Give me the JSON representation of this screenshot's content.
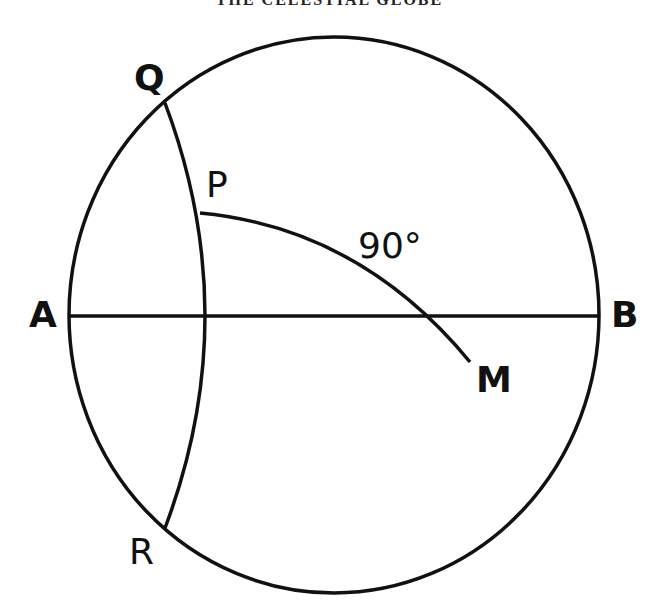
{
  "running_head": "THE CELESTIAL GLOBE",
  "diagram": {
    "points": {
      "Q": "Q",
      "P": "P",
      "A": "A",
      "B": "B",
      "M": "M",
      "R": "R"
    },
    "angle_label": "90°",
    "stroke_color": "#111111",
    "background": "#ffffff"
  }
}
